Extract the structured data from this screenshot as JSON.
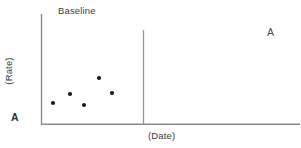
{
  "figure": {
    "background_color": "#ffffff",
    "width": 301,
    "height": 148
  },
  "labels": {
    "phase_title": "Baseline",
    "x_axis": "(Date)",
    "y_axis": "(Rate)",
    "phase_marker_left": "A",
    "phase_marker_right": "A"
  },
  "chart_data": {
    "type": "scatter",
    "title": "Baseline",
    "xlabel": "(Date)",
    "ylabel": "(Rate)",
    "grid": false,
    "legend": null,
    "axis_color": "#8a8a8a",
    "point_color": "#1a1a1a",
    "point_radius": 2.1,
    "xlim": [
      0,
      10
    ],
    "ylim": [
      0,
      10
    ],
    "phases": [
      {
        "label": "A",
        "name": "Baseline",
        "divider_x": 4.0
      }
    ],
    "x": [
      1.16,
      2.25,
      3.32,
      4.47,
      5.47
    ],
    "y": [
      1.91,
      2.73,
      1.73,
      4.18,
      2.82
    ],
    "points": [
      {
        "x": 1.16,
        "y": 1.91,
        "px": 53,
        "py": 103
      },
      {
        "x": 2.25,
        "y": 2.73,
        "px": 70,
        "py": 94
      },
      {
        "x": 3.32,
        "y": 1.73,
        "px": 84,
        "py": 105
      },
      {
        "x": 4.47,
        "y": 4.18,
        "px": 99,
        "py": 78
      },
      {
        "x": 5.47,
        "y": 2.82,
        "px": 112,
        "py": 93
      }
    ],
    "axes_geometry": {
      "y_axis_x": 41,
      "y_axis_top": 14,
      "y_axis_bottom": 124,
      "x_axis_y": 124,
      "x_axis_left": 41,
      "x_axis_right": 300,
      "divider_x": 143,
      "divider_top": 30,
      "divider_bottom": 124
    }
  }
}
